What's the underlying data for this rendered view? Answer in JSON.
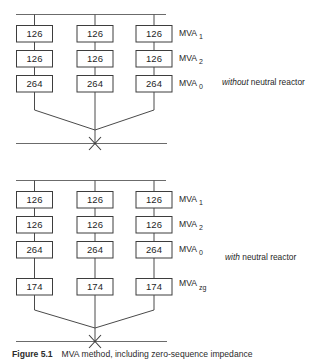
{
  "figure": {
    "title_fragment": "Figure 5.1",
    "caption_fragment": "MVA method, including zero-sequence impedance",
    "background_color": "#ffffff",
    "line_color": "#4a4a4a",
    "box_border_color": "#3d3d3d"
  },
  "sections": [
    {
      "id": "without-neutral-reactor",
      "annotation_emphasis": "without",
      "annotation_rest": " neutral reactor",
      "rows": [
        {
          "label_base": "MVA",
          "label_sub": "1",
          "values": [
            "126",
            "126",
            "126"
          ]
        },
        {
          "label_base": "MVA",
          "label_sub": "2",
          "values": [
            "126",
            "126",
            "126"
          ]
        },
        {
          "label_base": "MVA",
          "label_sub": "0",
          "values": [
            "264",
            "264",
            "264"
          ]
        }
      ]
    },
    {
      "id": "with-neutral-reactor",
      "annotation_emphasis": "with",
      "annotation_rest": " neutral reactor",
      "rows": [
        {
          "label_base": "MVA",
          "label_sub": "1",
          "values": [
            "126",
            "126",
            "126"
          ]
        },
        {
          "label_base": "MVA",
          "label_sub": "2",
          "values": [
            "126",
            "126",
            "126"
          ]
        },
        {
          "label_base": "MVA",
          "label_sub": "0",
          "values": [
            "264",
            "264",
            "264"
          ]
        },
        {
          "label_base": "MVA",
          "label_sub": "zg",
          "values": [
            "174",
            "174",
            "174"
          ]
        }
      ]
    }
  ]
}
